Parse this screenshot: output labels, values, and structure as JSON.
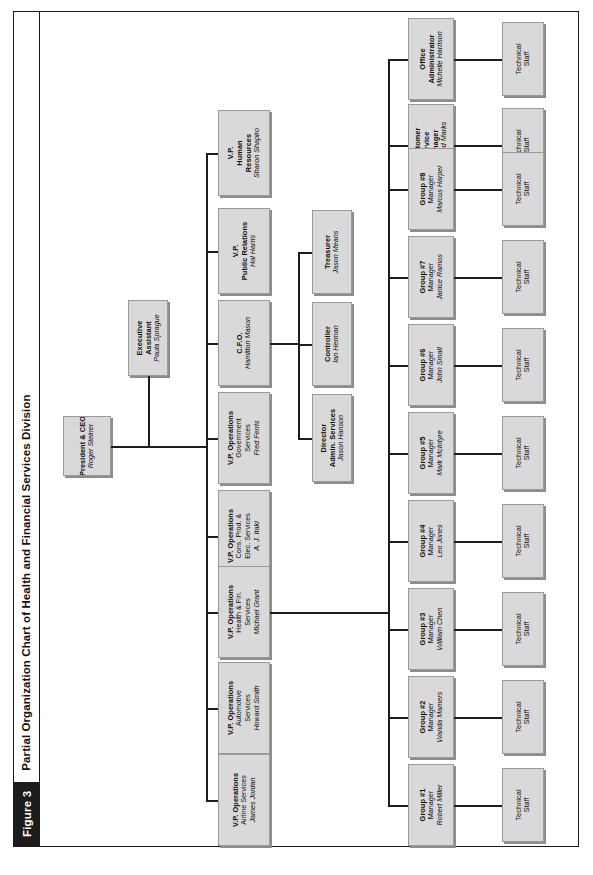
{
  "figure": {
    "number_label": "Figure 3",
    "title": "Partial Organization Chart of Health and Financial Services Division"
  },
  "colors": {
    "box_fill": "#d9d9d9",
    "box_border": "#9a9a9a",
    "box_shadow": "#8d8d8d",
    "line": "#1d1d1d",
    "figure_tag_bg": "#1c1c1c",
    "figure_tag_fg": "#ffffff",
    "frame": "#1a1a1a",
    "page_bg": "#ffffff"
  },
  "nodes": {
    "ceo": {
      "title": "President & CEO",
      "name": "Roger Steiner"
    },
    "exec_assistant": {
      "title": "Executive\nAssistant",
      "line1": "Executive",
      "line2": "Assistant",
      "name": "Paula Sprague"
    },
    "vp_hr": {
      "line1": "V.P.",
      "line2": "Human",
      "line3": "Resources",
      "name": "Sharon Shapiro"
    },
    "vp_pr": {
      "line1": "V.P.",
      "line2": "Public Relations",
      "name": "Hal Harris"
    },
    "cfo": {
      "line1": "C.F.O.",
      "name": "Hamilton Mason"
    },
    "vp_gov": {
      "line1": "V.P. Operations",
      "line2": "Government",
      "line3": "Services",
      "name": "Fred Ferris"
    },
    "vp_cons": {
      "line1": "V.P. Operations",
      "line2": "Cons. Prod. &",
      "line3": "Elec. Services",
      "name": "A. J. Itaki"
    },
    "vp_health": {
      "line1": "V.P. Operations",
      "line2": "Health & Fin.",
      "line3": "Services",
      "name": "Michael Grant"
    },
    "vp_auto": {
      "line1": "V.P. Operations",
      "line2": "Automotive",
      "line3": "Services",
      "name": "Howard Smith"
    },
    "vp_airline": {
      "line1": "V.P. Operations",
      "line2": "Airline Services",
      "name": "James Jordan"
    },
    "treasurer": {
      "line1": "Treasurer",
      "name": "Jason Means"
    },
    "controller": {
      "line1": "Controller",
      "name": "Ian Herman"
    },
    "director_admin": {
      "line1": "Director",
      "line2": "Admin. Services",
      "name": "Jason Hanson"
    },
    "office_admin": {
      "line1": "Office",
      "line2": "Administrator",
      "name": "Michelle Harrison"
    },
    "customer_service": {
      "line1": "Customer",
      "line2": "Service",
      "line3": "Manager",
      "name": "Armand Marks"
    }
  },
  "groups": [
    {
      "id": "group1",
      "line1": "Group #1",
      "line2": "Manager",
      "name": "Robert Miller"
    },
    {
      "id": "group2",
      "line1": "Group #2",
      "line2": "Manager",
      "name": "Wanda Mamers"
    },
    {
      "id": "group3",
      "line1": "Group #3",
      "line2": "Manager",
      "name": "William Chen"
    },
    {
      "id": "group4",
      "line1": "Group #4",
      "line2": "Manager",
      "name": "Leo Jones"
    },
    {
      "id": "group5",
      "line1": "Group #5",
      "line2": "Manager",
      "name": "Mark McIntyre"
    },
    {
      "id": "group6",
      "line1": "Group #6",
      "line2": "Manager",
      "name": "John Small"
    },
    {
      "id": "group7",
      "line1": "Group #7",
      "line2": "Manager",
      "name": "Janice Ramos"
    },
    {
      "id": "group8",
      "line1": "Group #8",
      "line2": "Manager",
      "name": "Marcus Harper"
    }
  ],
  "technical_staff": {
    "line1": "Technical",
    "line2": "Staff",
    "count": 10
  }
}
